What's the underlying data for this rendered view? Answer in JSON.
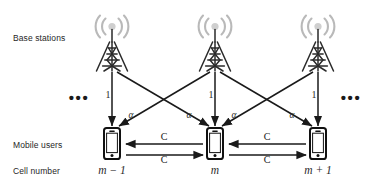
{
  "figure": {
    "width": 377,
    "height": 186,
    "background": "#ffffff",
    "type": "network-topology-diagram",
    "colors": {
      "line": "#1a1a1a",
      "text": "#262626",
      "tower_dark": "#1d1d1d",
      "tower_light": "#b3b3b3",
      "phone_body": "#111111",
      "phone_screen": "#ffffff"
    }
  },
  "row_labels": {
    "base_stations": "Base stations",
    "mobile_users": "Mobile users",
    "cell_number": "Cell number"
  },
  "cells": [
    {
      "id": "cell-m-minus-1",
      "label": "m − 1",
      "x": 112,
      "tower_gain_label": "1",
      "base_station_icon": "cell-tower-icon",
      "mobile_user_icon": "smartphone-icon"
    },
    {
      "id": "cell-m",
      "label": "m",
      "x": 215,
      "tower_gain_label": "1",
      "base_station_icon": "cell-tower-icon",
      "mobile_user_icon": "smartphone-icon"
    },
    {
      "id": "cell-m-plus-1",
      "label": "m + 1",
      "x": 318,
      "tower_gain_label": "1",
      "base_station_icon": "cell-tower-icon",
      "mobile_user_icon": "smartphone-icon"
    }
  ],
  "interference_labels": [
    {
      "id": "alpha-1",
      "text": "α",
      "x": 131,
      "y": 116
    },
    {
      "id": "alpha-2",
      "text": "α",
      "x": 189,
      "y": 116
    },
    {
      "id": "alpha-3",
      "text": "α",
      "x": 234,
      "y": 116
    },
    {
      "id": "alpha-4",
      "text": "α",
      "x": 292,
      "y": 116
    }
  ],
  "cooperation_links": [
    {
      "id": "link-left-upper",
      "label": "C",
      "direction": "left",
      "label_x": 164,
      "label_y": 137
    },
    {
      "id": "link-left-lower",
      "label": "C",
      "direction": "right",
      "label_x": 164,
      "label_y": 160
    },
    {
      "id": "link-right-upper",
      "label": "C",
      "direction": "left",
      "label_x": 267,
      "label_y": 137
    },
    {
      "id": "link-right-lower",
      "label": "C",
      "direction": "right",
      "label_x": 267,
      "label_y": 160
    }
  ],
  "continuation": {
    "left": "•••",
    "right": "•••"
  }
}
